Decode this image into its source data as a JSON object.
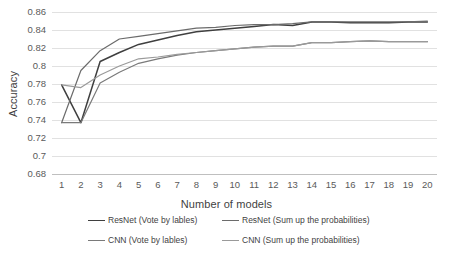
{
  "chart_data": {
    "type": "line",
    "title": "",
    "xlabel": "Number of models",
    "ylabel": "Accuracy",
    "x": [
      1,
      2,
      3,
      4,
      5,
      6,
      7,
      8,
      9,
      10,
      11,
      12,
      13,
      14,
      15,
      16,
      17,
      18,
      19,
      20
    ],
    "xtick_labels": [
      "1",
      "2",
      "3",
      "4",
      "5",
      "6",
      "7",
      "8",
      "9",
      "10",
      "11",
      "12",
      "13",
      "14",
      "15",
      "16",
      "17",
      "18",
      "19",
      "20"
    ],
    "ytick_labels": [
      "0.68",
      "0.7",
      "0.72",
      "0.74",
      "0.76",
      "0.78",
      "0.8",
      "0.82",
      "0.84",
      "0.86"
    ],
    "ytick_values": [
      0.68,
      0.7,
      0.72,
      0.74,
      0.76,
      0.78,
      0.8,
      0.82,
      0.84,
      0.86
    ],
    "ylim": [
      0.68,
      0.86
    ],
    "xlim": [
      1,
      20
    ],
    "grid": "horizontal",
    "legend_position": "bottom",
    "series": [
      {
        "name": "ResNet (Vote by lables)",
        "color": "#3f3f3f",
        "values": [
          0.779,
          0.737,
          0.805,
          0.815,
          0.824,
          0.829,
          0.834,
          0.838,
          0.84,
          0.842,
          0.844,
          0.846,
          0.845,
          0.849,
          0.849,
          0.848,
          0.848,
          0.848,
          0.849,
          0.849
        ]
      },
      {
        "name": "ResNet (Sum up the probabilities)",
        "color": "#6b6b6b",
        "values": [
          0.737,
          0.795,
          0.817,
          0.83,
          0.833,
          0.836,
          0.839,
          0.842,
          0.843,
          0.845,
          0.846,
          0.846,
          0.847,
          0.849,
          0.849,
          0.849,
          0.849,
          0.849,
          0.849,
          0.85
        ]
      },
      {
        "name": "CNN (Vote by lables)",
        "color": "#7a7a7a",
        "values": [
          0.737,
          0.737,
          0.781,
          0.793,
          0.803,
          0.808,
          0.812,
          0.815,
          0.817,
          0.819,
          0.821,
          0.822,
          0.822,
          0.826,
          0.826,
          0.827,
          0.828,
          0.827,
          0.827,
          0.827
        ]
      },
      {
        "name": "CNN (Sum up the probabilities)",
        "color": "#9a9a9a",
        "values": [
          0.779,
          0.776,
          0.79,
          0.8,
          0.808,
          0.81,
          0.813,
          0.815,
          0.817,
          0.819,
          0.821,
          0.822,
          0.822,
          0.826,
          0.826,
          0.827,
          0.828,
          0.827,
          0.827,
          0.827
        ]
      }
    ]
  },
  "legend": {
    "items": [
      {
        "label": "ResNet (Vote by lables)",
        "color": "#3f3f3f"
      },
      {
        "label": "ResNet (Sum up the probabilities)",
        "color": "#6b6b6b"
      },
      {
        "label": "CNN (Vote by lables)",
        "color": "#7a7a7a"
      },
      {
        "label": "CNN (Sum up the probabilities)",
        "color": "#9a9a9a"
      }
    ]
  },
  "axes": {
    "y_title": "Accuracy",
    "x_title": "Number of models"
  },
  "colors": {
    "gridline": "#d9d9d9",
    "axis_line": "#bfbfbf",
    "tick_text": "#5a5a5a",
    "title_text": "#3f3f3f",
    "background": "#ffffff"
  }
}
